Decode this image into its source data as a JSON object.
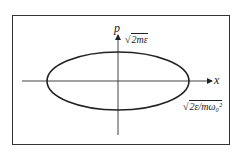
{
  "diagram": {
    "type": "phase-space ellipse",
    "axes": {
      "horizontal_label": "x",
      "vertical_label": "p"
    },
    "annotations": {
      "p_intercept": {
        "radical": "√",
        "radicand": "2mε"
      },
      "x_intercept": {
        "radical": "√",
        "radicand": "2ε/mω₀²"
      }
    },
    "colors": {
      "stroke": "#222222",
      "background": "#ffffff"
    }
  }
}
